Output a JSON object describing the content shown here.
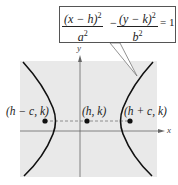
{
  "equation": {
    "term1_numerator": "(x − h)",
    "term1_denominator": "a",
    "operator": "−",
    "term2_numerator": "(y − k)",
    "term2_denominator": "b",
    "exponent": "2",
    "rhs": "= 1"
  },
  "axes": {
    "x_label": "x",
    "y_label": "y"
  },
  "points": [
    {
      "label": "(h − c, k)",
      "role": "focus-left"
    },
    {
      "label": "(h, k)",
      "role": "center"
    },
    {
      "label": "(h + c, k)",
      "role": "focus-right"
    }
  ],
  "colors": {
    "panel_background": "#e9e9e9",
    "curve": "#111111",
    "axis": "#666666",
    "dashed_line": "#777777",
    "callout_border": "#555555"
  }
}
